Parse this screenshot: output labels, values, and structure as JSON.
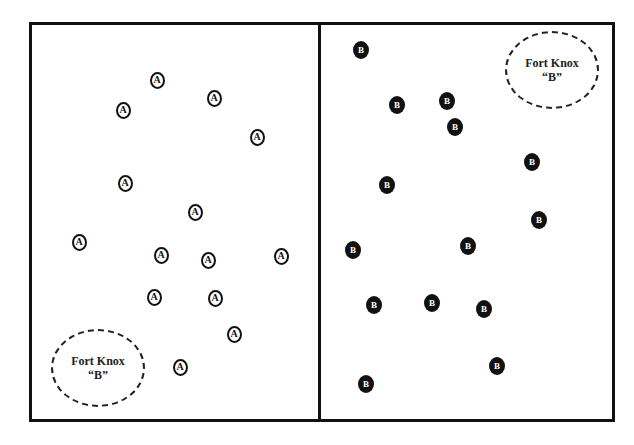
{
  "diagram": {
    "panels": [
      {
        "side": "left",
        "marker_style": "outlined-circle",
        "marker_label": "A",
        "markers": [
          {
            "label": "A"
          },
          {
            "label": "A"
          },
          {
            "label": "A"
          },
          {
            "label": "A"
          },
          {
            "label": "A"
          },
          {
            "label": "A"
          },
          {
            "label": "A"
          },
          {
            "label": "A"
          },
          {
            "label": "A"
          },
          {
            "label": "A"
          },
          {
            "label": "A"
          },
          {
            "label": "A"
          },
          {
            "label": "A"
          },
          {
            "label": "A"
          }
        ],
        "fort": {
          "title": "Fort Knox",
          "subtitle": "“B”"
        }
      },
      {
        "side": "right",
        "marker_style": "filled-circle",
        "marker_label": "B",
        "markers": [
          {
            "label": "B"
          },
          {
            "label": "B"
          },
          {
            "label": "B"
          },
          {
            "label": "B"
          },
          {
            "label": "B"
          },
          {
            "label": "B"
          },
          {
            "label": "B"
          },
          {
            "label": "B"
          },
          {
            "label": "B"
          },
          {
            "label": "B"
          },
          {
            "label": "B"
          },
          {
            "label": "B"
          },
          {
            "label": "B"
          },
          {
            "label": "B"
          }
        ],
        "fort": {
          "title": "Fort Knox",
          "subtitle": "“B”"
        }
      }
    ],
    "colors": {
      "ink": "#111111",
      "background": "#ffffff"
    }
  }
}
